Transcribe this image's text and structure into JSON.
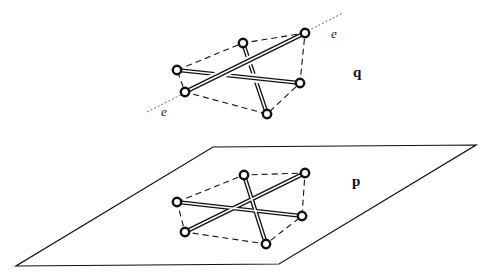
{
  "figure": {
    "labels": {
      "upper_configuration": "q",
      "lower_configuration": "p",
      "line_label_top": "e",
      "line_label_bottom": "e"
    },
    "colors": {
      "background": "#ffffff",
      "ink": "#111111"
    },
    "plane": {
      "corners": [
        [
          213,
          147
        ],
        [
          476,
          145
        ],
        [
          279,
          264
        ],
        [
          16,
          266
        ]
      ]
    },
    "upper": {
      "nodes": [
        [
          177,
          70
        ],
        [
          243,
          43
        ],
        [
          305,
          33
        ],
        [
          300,
          83
        ],
        [
          267,
          114
        ],
        [
          185,
          92
        ]
      ],
      "dashed_hull": [
        [
          177,
          70
        ],
        [
          243,
          43
        ],
        [
          305,
          33
        ],
        [
          300,
          83
        ],
        [
          267,
          114
        ],
        [
          185,
          92
        ]
      ],
      "bars": [
        {
          "from": [
            185,
            92
          ],
          "to": [
            305,
            33
          ],
          "layer": "top"
        },
        {
          "from": [
            177,
            70
          ],
          "to": [
            300,
            83
          ],
          "layer": "middle"
        },
        {
          "from": [
            243,
            43
          ],
          "to": [
            267,
            114
          ],
          "layer": "bottom"
        }
      ],
      "axis_line": {
        "from": [
          147,
          112
        ],
        "to": [
          343,
          13
        ]
      },
      "e_label_positions": [
        [
          333,
          37
        ],
        [
          163,
          115
        ]
      ],
      "label_position": [
        355,
        77
      ]
    },
    "lower": {
      "nodes": [
        [
          177,
          202
        ],
        [
          244,
          175
        ],
        [
          305,
          173
        ],
        [
          302,
          216
        ],
        [
          266,
          244
        ],
        [
          185,
          232
        ]
      ],
      "dashed_hull": [
        [
          177,
          202
        ],
        [
          244,
          175
        ],
        [
          305,
          173
        ],
        [
          302,
          216
        ],
        [
          266,
          244
        ],
        [
          185,
          232
        ]
      ],
      "bars": [
        {
          "from": [
            185,
            232
          ],
          "to": [
            305,
            173
          ]
        },
        {
          "from": [
            177,
            202
          ],
          "to": [
            302,
            216
          ]
        },
        {
          "from": [
            244,
            175
          ],
          "to": [
            266,
            244
          ]
        }
      ],
      "label_position": [
        352,
        187
      ]
    }
  }
}
